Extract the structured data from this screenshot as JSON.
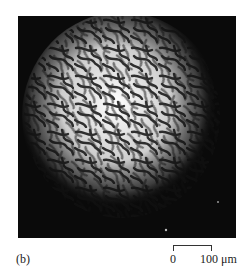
{
  "figure": {
    "panel_label": "(b)",
    "image_description": "labyrinth stripe domain pattern micrograph",
    "scale_bar": {
      "start_label": "0",
      "end_label": "100 μm"
    },
    "colors": {
      "background": "#0a0a0a",
      "stripe_light": "#f2f2f2",
      "stripe_dark": "#1a1a1a"
    }
  }
}
